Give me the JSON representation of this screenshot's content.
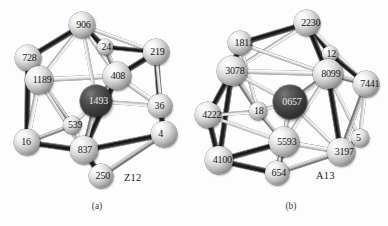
{
  "figure": {
    "type": "scientific-illustration",
    "background_color": "#fdfdfd",
    "atom_color": "#cfcfcf",
    "center_atom_color": "#343434",
    "label_color": "#141414"
  },
  "panels": [
    {
      "id": "a",
      "caption": "(a)",
      "tag": "Z12",
      "atoms": [
        {
          "label": "906",
          "cx": 82,
          "cy": 25,
          "r": 13,
          "kind": "shell"
        },
        {
          "label": "24",
          "cx": 105,
          "cy": 47,
          "r": 8,
          "kind": "shell"
        },
        {
          "label": "219",
          "cx": 156,
          "cy": 52,
          "r": 13,
          "kind": "shell"
        },
        {
          "label": "728",
          "cx": 28,
          "cy": 58,
          "r": 13,
          "kind": "shell"
        },
        {
          "label": "1189",
          "cx": 39,
          "cy": 80,
          "r": 14,
          "kind": "shell"
        },
        {
          "label": "408",
          "cx": 117,
          "cy": 76,
          "r": 14,
          "kind": "shell"
        },
        {
          "label": "1493",
          "cx": 96,
          "cy": 101,
          "r": 16,
          "kind": "center"
        },
        {
          "label": "36",
          "cx": 160,
          "cy": 106,
          "r": 12,
          "kind": "shell"
        },
        {
          "label": "539",
          "cx": 72,
          "cy": 125,
          "r": 9,
          "kind": "shell"
        },
        {
          "label": "4",
          "cx": 164,
          "cy": 134,
          "r": 13,
          "kind": "shell"
        },
        {
          "label": "16",
          "cx": 27,
          "cy": 142,
          "r": 13,
          "kind": "shell"
        },
        {
          "label": "837",
          "cx": 84,
          "cy": 150,
          "r": 14,
          "kind": "shell"
        },
        {
          "label": "250",
          "cx": 101,
          "cy": 176,
          "r": 12,
          "kind": "shell"
        }
      ]
    },
    {
      "id": "b",
      "caption": "(b)",
      "tag": "A13",
      "atoms": [
        {
          "label": "2230",
          "cx": 113,
          "cy": 23,
          "r": 13,
          "kind": "shell"
        },
        {
          "label": "1811",
          "cx": 46,
          "cy": 43,
          "r": 12,
          "kind": "shell"
        },
        {
          "label": "12",
          "cx": 136,
          "cy": 54,
          "r": 8,
          "kind": "shell"
        },
        {
          "label": "3078",
          "cx": 38,
          "cy": 71,
          "r": 15,
          "kind": "shell"
        },
        {
          "label": "8099",
          "cx": 134,
          "cy": 74,
          "r": 15,
          "kind": "shell"
        },
        {
          "label": "7441",
          "cx": 172,
          "cy": 84,
          "r": 13,
          "kind": "shell"
        },
        {
          "label": "0657",
          "cx": 96,
          "cy": 102,
          "r": 17,
          "kind": "center"
        },
        {
          "label": "18",
          "cx": 64,
          "cy": 111,
          "r": 9,
          "kind": "shell"
        },
        {
          "label": "4222",
          "cx": 14,
          "cy": 115,
          "r": 13,
          "kind": "shell"
        },
        {
          "label": "5",
          "cx": 166,
          "cy": 138,
          "r": 9,
          "kind": "shell"
        },
        {
          "label": "5593",
          "cx": 90,
          "cy": 142,
          "r": 15,
          "kind": "shell"
        },
        {
          "label": "3197",
          "cx": 147,
          "cy": 152,
          "r": 14,
          "kind": "shell"
        },
        {
          "label": "4100",
          "cx": 25,
          "cy": 160,
          "r": 14,
          "kind": "shell"
        },
        {
          "label": "654",
          "cx": 83,
          "cy": 173,
          "r": 12,
          "kind": "shell"
        }
      ]
    }
  ]
}
